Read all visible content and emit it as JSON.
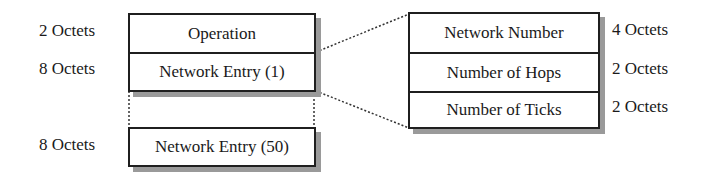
{
  "left_packet": {
    "fields": [
      {
        "label": "Operation",
        "size": "2 Octets"
      },
      {
        "label": "Network Entry (1)",
        "size": "8 Octets"
      },
      {
        "label": "Network Entry (50)",
        "size": "8 Octets"
      }
    ]
  },
  "network_entry_detail": {
    "fields": [
      {
        "label": "Network Number",
        "size": "4 Octets"
      },
      {
        "label": "Number of Hops",
        "size": "2 Octets"
      },
      {
        "label": "Number of Ticks",
        "size": "2 Octets"
      }
    ]
  }
}
